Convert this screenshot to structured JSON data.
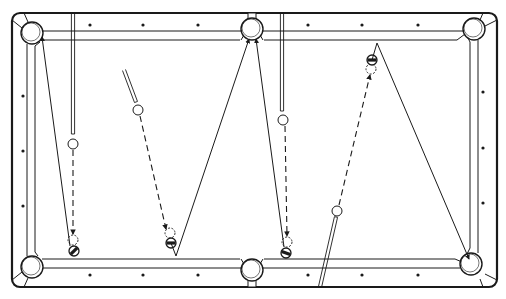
{
  "figure": {
    "title": "Pool table shot diagram"
  },
  "table": {
    "outer": {
      "x": 12,
      "y": 13,
      "w": 485,
      "h": 274,
      "r": 8
    },
    "colors": {
      "line": "#1a1a1a",
      "felt": "#ffffff",
      "rail": "#ffffff"
    },
    "pockets": [
      {
        "id": "top-left",
        "cx": 32,
        "cy": 33,
        "r": 11
      },
      {
        "id": "top-side",
        "cx": 252,
        "cy": 29,
        "r": 11
      },
      {
        "id": "top-right",
        "cx": 474,
        "cy": 29,
        "r": 11
      },
      {
        "id": "bottom-left",
        "cx": 32,
        "cy": 267,
        "r": 11
      },
      {
        "id": "bottom-side",
        "cx": 252,
        "cy": 270,
        "r": 11
      },
      {
        "id": "bottom-right",
        "cx": 471,
        "cy": 264,
        "r": 11
      }
    ],
    "diamonds": {
      "top": [
        [
          90,
          25
        ],
        [
          143,
          25
        ],
        [
          198,
          25
        ],
        [
          308,
          25
        ],
        [
          362,
          25
        ],
        [
          418,
          25
        ]
      ],
      "bottom": [
        [
          90,
          275
        ],
        [
          143,
          275
        ],
        [
          198,
          275
        ],
        [
          308,
          275
        ],
        [
          362,
          275
        ],
        [
          418,
          275
        ]
      ],
      "left": [
        [
          23,
          96
        ],
        [
          23,
          151
        ],
        [
          23,
          206
        ]
      ],
      "right": [
        [
          483,
          92
        ],
        [
          483,
          148
        ],
        [
          483,
          203
        ]
      ]
    }
  },
  "shots": [
    {
      "id": "shot-1",
      "cue_stick": {
        "x1": 73,
        "y1": 13,
        "x2": 73,
        "y2": 134
      },
      "cue_ball": {
        "cx": 73,
        "cy": 144,
        "r": 5
      },
      "cue_path": {
        "x1": 73,
        "y1": 150,
        "x2": 73,
        "y2": 234
      },
      "ghost_ball": {
        "cx": 73,
        "cy": 240,
        "r": 5
      },
      "object_ball": {
        "cx": 74,
        "cy": 251,
        "r": 5,
        "stripe_angle": -45
      },
      "object_path": [
        [
          70,
          246
        ],
        [
          42,
          37
        ]
      ],
      "target_pocket": "top-left"
    },
    {
      "id": "shot-2",
      "cue_stick": {
        "x1": 124,
        "y1": 70,
        "x2": 136,
        "y2": 102
      },
      "cue_ball": {
        "cx": 138,
        "cy": 110,
        "r": 5
      },
      "cue_path": {
        "x1": 140,
        "y1": 116,
        "x2": 166,
        "y2": 229
      },
      "ghost_ball": {
        "cx": 170,
        "cy": 233,
        "r": 5
      },
      "object_ball": {
        "cx": 171,
        "cy": 243,
        "r": 5,
        "stripe_angle": 0
      },
      "object_path": [
        [
          176,
          256
        ],
        [
          249,
          39
        ]
      ],
      "bank_vertex": [
        176,
        256
      ],
      "target_pocket": "top-side"
    },
    {
      "id": "shot-3",
      "cue_stick": {
        "x1": 282,
        "y1": 13,
        "x2": 282,
        "y2": 111
      },
      "cue_ball": {
        "cx": 283,
        "cy": 120,
        "r": 5
      },
      "cue_path": {
        "x1": 285,
        "y1": 126,
        "x2": 287,
        "y2": 236
      },
      "ghost_ball": {
        "cx": 287,
        "cy": 242,
        "r": 5
      },
      "object_ball": {
        "cx": 286,
        "cy": 253,
        "r": 5,
        "stripe_angle": 20
      },
      "object_path": [
        [
          284,
          247
        ],
        [
          256,
          39
        ]
      ],
      "target_pocket": "top-side"
    },
    {
      "id": "shot-4",
      "cue_stick": {
        "x1": 320,
        "y1": 287,
        "x2": 336,
        "y2": 217
      },
      "cue_ball": {
        "cx": 337,
        "cy": 211,
        "r": 5
      },
      "cue_path": {
        "x1": 339,
        "y1": 205,
        "x2": 370,
        "y2": 75
      },
      "ghost_ball": {
        "cx": 371,
        "cy": 69,
        "r": 5
      },
      "object_ball": {
        "cx": 372,
        "cy": 60,
        "r": 5,
        "stripe_angle": 0
      },
      "object_path": [
        [
          377,
          43
        ],
        [
          469,
          259
        ]
      ],
      "bank_vertex": [
        377,
        43
      ],
      "target_pocket": "bottom-right"
    }
  ]
}
